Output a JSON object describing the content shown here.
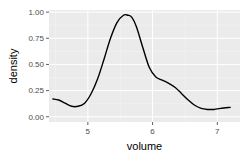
{
  "chart_data": {
    "type": "line",
    "title": "",
    "xlabel": "volume",
    "ylabel": "density",
    "xlim": [
      4.4,
      7.35
    ],
    "ylim": [
      -0.05,
      1.02
    ],
    "xticks": [
      5,
      6,
      7
    ],
    "xtick_labels": [
      "5",
      "6",
      "7"
    ],
    "yticks": [
      0,
      0.25,
      0.5,
      0.75,
      1.0
    ],
    "ytick_labels": [
      "0.00",
      "0.25",
      "0.50",
      "0.75",
      "1.00"
    ],
    "grid": true,
    "legend": "none",
    "series": [
      {
        "name": "density",
        "x": [
          4.46,
          4.55,
          4.65,
          4.75,
          4.85,
          4.95,
          5.05,
          5.15,
          5.25,
          5.35,
          5.45,
          5.55,
          5.62,
          5.68,
          5.75,
          5.85,
          5.95,
          6.05,
          6.15,
          6.25,
          6.35,
          6.45,
          6.55,
          6.65,
          6.75,
          6.85,
          6.95,
          7.05,
          7.2
        ],
        "values": [
          0.17,
          0.16,
          0.13,
          0.1,
          0.1,
          0.13,
          0.22,
          0.36,
          0.55,
          0.75,
          0.9,
          0.97,
          0.97,
          0.95,
          0.86,
          0.66,
          0.47,
          0.38,
          0.35,
          0.32,
          0.28,
          0.22,
          0.16,
          0.11,
          0.08,
          0.07,
          0.07,
          0.08,
          0.09
        ]
      }
    ],
    "colors": {
      "panel_background": "#ebebeb",
      "grid_major": "#ffffff",
      "grid_minor": "#f5f5f5",
      "line": "#000000",
      "tick_label": "#4d4d4d",
      "tick_mark": "#333333"
    }
  }
}
